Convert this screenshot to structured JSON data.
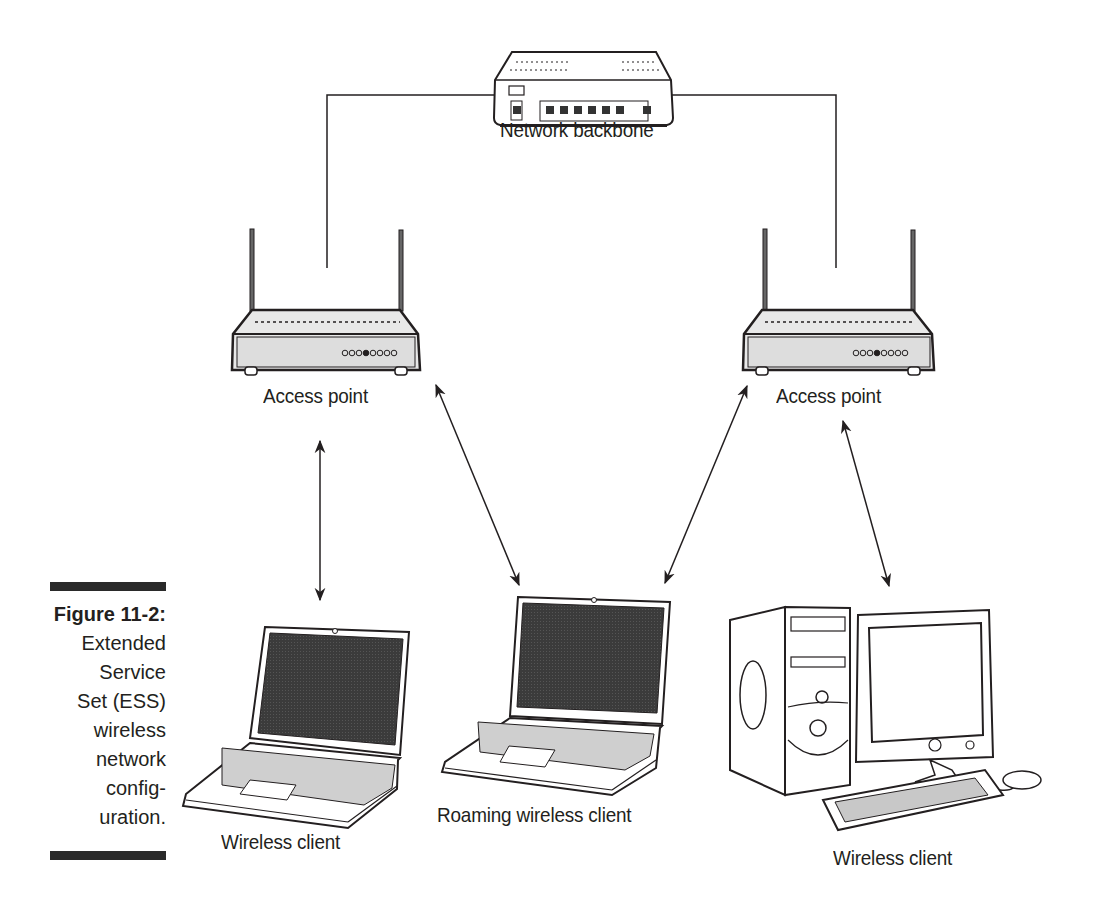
{
  "figure": {
    "number": "Figure 11-2:",
    "caption_lines": [
      "Extended",
      "Service",
      "Set (ESS)",
      "wireless",
      "network",
      "config-",
      "uration."
    ]
  },
  "nodes": {
    "backbone": {
      "label": "Network backbone"
    },
    "ap_left": {
      "label": "Access point"
    },
    "ap_right": {
      "label": "Access point"
    },
    "client_left": {
      "label": "Wireless client"
    },
    "client_roaming": {
      "label": "Roaming wireless client"
    },
    "client_right": {
      "label": "Wireless client"
    }
  },
  "colors": {
    "line": "#231f20",
    "screen": "#3a3a3a",
    "device_fill": "#f2f2f2"
  }
}
